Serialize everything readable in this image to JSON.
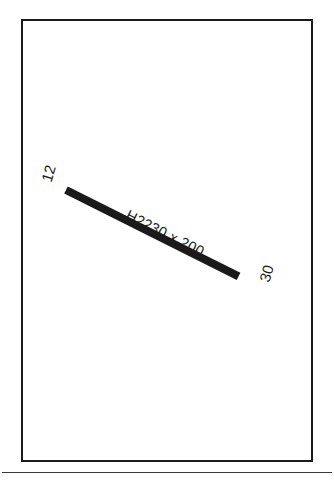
{
  "drawing": {
    "title": "structural-member-detail",
    "background_color": "#ffffff",
    "frame": {
      "name": "drawing-border",
      "stroke_color": "#1b1b1b",
      "stroke_width_px": 2.5
    },
    "bottom_rule": {
      "name": "horizontal-separator-line",
      "stroke_color": "#3a3a3a",
      "stroke_width_px": 1.6
    },
    "member": {
      "name": "beam-member",
      "size_label": "H2230 x 200",
      "fill_color": "#1a1a1a",
      "thickness_px": 8,
      "angle_deg": 26.6,
      "start_node": "12",
      "end_node": "30"
    },
    "node_labels": {
      "start": "12",
      "end": "30",
      "rotation_deg": -73,
      "color": "#1b1b1b"
    }
  },
  "chart_data": {
    "type": "diagram",
    "elements": [
      {
        "kind": "member",
        "label": "H2230 x 200",
        "from_node": "12",
        "to_node": "30",
        "start_xy": [
          66,
          186
        ],
        "end_xy": [
          259,
          273
        ]
      },
      {
        "kind": "node",
        "label": "12",
        "xy": [
          52,
          180
        ]
      },
      {
        "kind": "node",
        "label": "30",
        "xy": [
          266,
          278
        ]
      }
    ]
  }
}
